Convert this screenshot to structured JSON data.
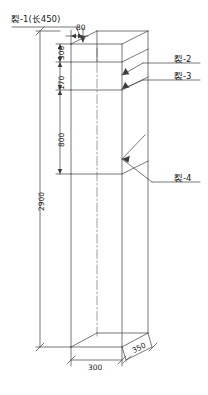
{
  "drawing": {
    "type": "isometric-column-crack-elevation",
    "line_color": "#3d3d3d",
    "text_color": "#1a1a1a"
  },
  "crack_labels": {
    "crack1": "裂-1(长450)",
    "crack2": "裂-2",
    "crack3": "裂-3",
    "crack4": "裂-4"
  },
  "dimensions": {
    "top_offset": "80",
    "seg1": "300",
    "seg2": "170",
    "seg3": "800",
    "total_height": "2900",
    "width": "300",
    "depth": "350"
  }
}
